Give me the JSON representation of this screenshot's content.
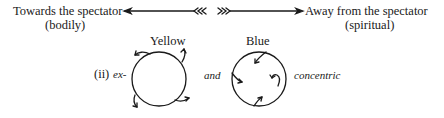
{
  "axis": {
    "left_label": "Towards the spectator",
    "left_sub": "(bodily)",
    "right_label": "Away from the spectator",
    "right_sub": "(spiritual)"
  },
  "figure": {
    "label": "(ii)",
    "prefix": "ex-",
    "connector": "and",
    "suffix": "concentric",
    "left_circle_label": "Yellow",
    "right_circle_label": "Blue"
  },
  "colors": {
    "ink": "#1a1a1a",
    "background": "#ffffff"
  }
}
